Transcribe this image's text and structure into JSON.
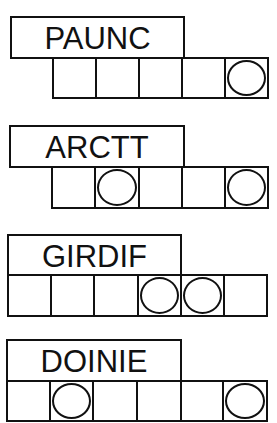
{
  "puzzles": [
    {
      "scrambled": "PAUNC",
      "letters": 5,
      "circled": [
        5
      ],
      "label_box": {
        "x": 10,
        "y": 16,
        "w": 175,
        "h": 43
      },
      "cells_box": {
        "x": 52,
        "y": 57,
        "cell_w": 43,
        "h": 42
      }
    },
    {
      "scrambled": "ARCTT",
      "letters": 5,
      "circled": [
        2,
        5
      ],
      "label_box": {
        "x": 9,
        "y": 125,
        "w": 176,
        "h": 43
      },
      "cells_box": {
        "x": 51,
        "y": 166,
        "cell_w": 43.2,
        "h": 43
      }
    },
    {
      "scrambled": "GIRDIF",
      "letters": 6,
      "circled": [
        4,
        5
      ],
      "label_box": {
        "x": 7,
        "y": 234,
        "w": 175,
        "h": 42
      },
      "cells_box": {
        "x": 7,
        "y": 274,
        "cell_w": 43,
        "h": 43
      }
    },
    {
      "scrambled": "DOINIE",
      "letters": 6,
      "circled": [
        2,
        6
      ],
      "label_box": {
        "x": 6,
        "y": 339,
        "w": 176,
        "h": 43
      },
      "cells_box": {
        "x": 6,
        "y": 380,
        "cell_w": 43.2,
        "h": 42
      }
    }
  ]
}
